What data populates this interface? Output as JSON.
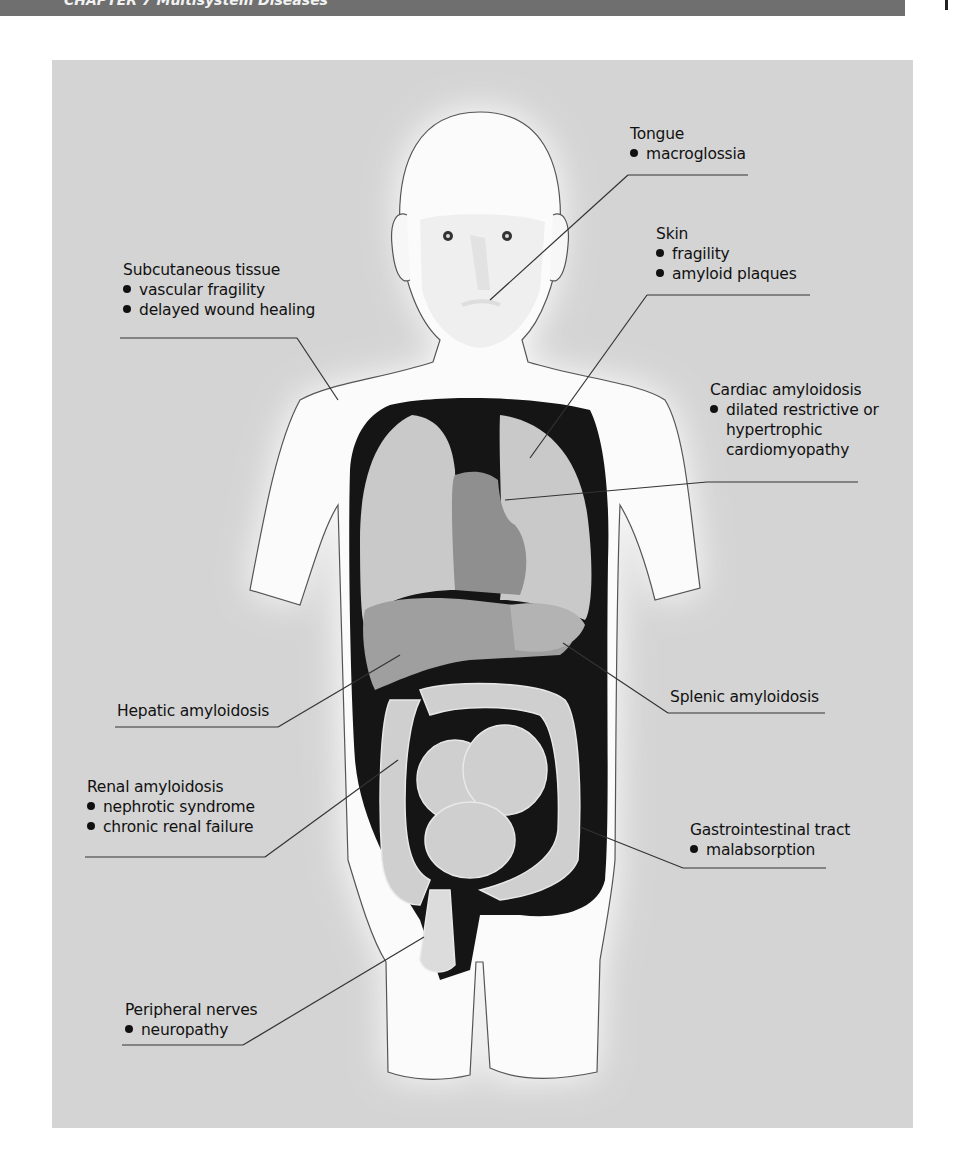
{
  "header": {
    "text": "CHAPTER 7 Multisystem Diseases",
    "bar_color": "#6f6f6f"
  },
  "figure": {
    "panel_color": "#d4d4d4",
    "callouts": [
      {
        "id": "tongue",
        "title": "Tongue",
        "items": [
          "macroglossia"
        ]
      },
      {
        "id": "skin",
        "title": "Skin",
        "items": [
          "fragility",
          "amyloid plaques"
        ]
      },
      {
        "id": "subcutaneous",
        "title": "Subcutaneous tissue",
        "items": [
          "vascular fragility",
          "delayed wound healing"
        ]
      },
      {
        "id": "cardiac",
        "title": "Cardiac amyloidosis",
        "items": [
          "dilated restrictive or"
        ],
        "continuation": [
          "hypertrophic",
          "cardiomyopathy"
        ]
      },
      {
        "id": "hepatic",
        "title": "Hepatic amyloidosis",
        "items": []
      },
      {
        "id": "splenic",
        "title": "Splenic amyloidosis",
        "items": []
      },
      {
        "id": "renal",
        "title": "Renal amyloidosis",
        "items": [
          "nephrotic syndrome",
          "chronic renal failure"
        ]
      },
      {
        "id": "gi",
        "title": "Gastrointestinal tract",
        "items": [
          "malabsorption"
        ]
      },
      {
        "id": "nerves",
        "title": "Peripheral nerves",
        "items": [
          "neuropathy"
        ]
      }
    ]
  }
}
